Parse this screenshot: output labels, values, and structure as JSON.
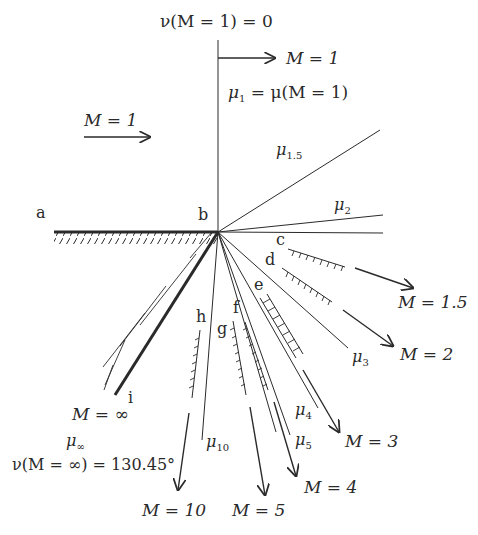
{
  "diagram": {
    "colors": {
      "ink": "#2a2a2a",
      "background": "#ffffff"
    },
    "top_label": {
      "prefix": "ν(M = 1) = 0"
    },
    "upstream_flow": {
      "label": "M = 1"
    },
    "sonic_flow": {
      "label": "M = 1",
      "mu_label": "μ",
      "mu_sub": "1",
      "mu_rest": " = μ(M = 1)"
    },
    "points": {
      "a": "a",
      "b": "b",
      "c": "c",
      "d": "d",
      "e": "e",
      "f": "f",
      "g": "g",
      "h": "h",
      "i": "i"
    },
    "mach_lines": [
      {
        "name": "mu_1.5",
        "mu": "μ",
        "sub": "1.5"
      },
      {
        "name": "mu_2",
        "mu": "μ",
        "sub": "2"
      },
      {
        "name": "mu_3",
        "mu": "μ",
        "sub": "3"
      },
      {
        "name": "mu_4",
        "mu": "μ",
        "sub": "4"
      },
      {
        "name": "mu_5",
        "mu": "μ",
        "sub": "5"
      },
      {
        "name": "mu_10",
        "mu": "μ",
        "sub": "10"
      },
      {
        "name": "mu_inf",
        "mu": "μ",
        "sub": "∞"
      }
    ],
    "flow_labels": [
      {
        "name": "M_1.5",
        "label": "M = 1.5"
      },
      {
        "name": "M_2",
        "label": "M = 2"
      },
      {
        "name": "M_3",
        "label": "M = 3"
      },
      {
        "name": "M_4",
        "label": "M = 4"
      },
      {
        "name": "M_5",
        "label": "M = 5"
      },
      {
        "name": "M_10",
        "label": "M = 10"
      },
      {
        "name": "M_inf",
        "label": "M = ∞"
      }
    ],
    "max_turn_label": "ν(M = ∞) = 130.45°"
  }
}
